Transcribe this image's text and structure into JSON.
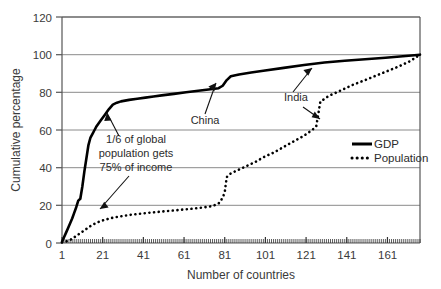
{
  "chart_data": {
    "type": "line",
    "title": "",
    "xlabel": "Number of countries",
    "ylabel": "Cumulative percentage",
    "xlim": [
      1,
      177
    ],
    "ylim": [
      0,
      120
    ],
    "xticks": [
      "1",
      "21",
      "41",
      "61",
      "81",
      "101",
      "121",
      "141",
      "161"
    ],
    "xtick_values": [
      1,
      21,
      41,
      61,
      81,
      101,
      121,
      141,
      161
    ],
    "yticks": [
      "0",
      "20",
      "40",
      "60",
      "80",
      "100",
      "120"
    ],
    "ytick_values": [
      0,
      20,
      40,
      60,
      80,
      100,
      120
    ],
    "grid": "horizontal",
    "legend_position": "right-middle",
    "series": [
      {
        "name": "GDP",
        "style": "solid",
        "color": "#000000",
        "x": [
          1,
          2,
          3,
          4,
          5,
          6,
          7,
          8,
          9,
          10,
          11,
          12,
          13,
          14,
          15,
          16,
          17,
          18,
          20,
          22,
          24,
          26,
          28,
          30,
          34,
          38,
          42,
          46,
          50,
          56,
          62,
          68,
          74,
          78,
          80,
          82,
          84,
          88,
          94,
          100,
          110,
          120,
          130,
          140,
          150,
          160,
          170,
          177
        ],
        "values": [
          0.5,
          3,
          5.5,
          8,
          10.5,
          13,
          16,
          19,
          22.5,
          23.5,
          30,
          38,
          45,
          52,
          56,
          58,
          60,
          62,
          65,
          68,
          71,
          73.5,
          74.5,
          75.2,
          76,
          76.6,
          77.2,
          77.8,
          78.4,
          79.2,
          80,
          80.8,
          81.6,
          82.2,
          83.5,
          86.5,
          88.5,
          89.5,
          90.5,
          91.5,
          93,
          94.5,
          95.8,
          96.8,
          97.6,
          98.4,
          99.3,
          100
        ]
      },
      {
        "name": "Population",
        "style": "dotted",
        "color": "#000000",
        "x": [
          1,
          3,
          5,
          7,
          9,
          11,
          13,
          15,
          17,
          19,
          21,
          25,
          30,
          35,
          40,
          45,
          50,
          55,
          60,
          65,
          70,
          75,
          78,
          80,
          81,
          82,
          84,
          88,
          92,
          96,
          100,
          105,
          110,
          115,
          120,
          124,
          125,
          126,
          128,
          132,
          138,
          144,
          150,
          158,
          166,
          172,
          177
        ],
        "values": [
          0.3,
          0.8,
          1.6,
          3,
          4.5,
          6,
          7.5,
          9,
          10.2,
          11.2,
          12,
          13.2,
          14.2,
          15,
          15.6,
          16.2,
          16.7,
          17.2,
          17.7,
          18.2,
          18.8,
          19.6,
          21,
          24,
          27,
          35,
          37,
          39,
          41,
          43,
          45.5,
          48,
          51,
          54,
          57,
          60,
          61,
          62,
          75,
          78,
          81,
          84,
          86.5,
          90,
          93.5,
          96.5,
          100
        ]
      }
    ],
    "annotations": [
      {
        "name": "income-annotation",
        "text_lines": [
          "1/6 of global",
          "population gets",
          "75% of income"
        ],
        "points_to": [
          "GDP curve near 21 countries",
          "Population curve near 25 countries"
        ]
      },
      {
        "name": "china-annotation",
        "text_lines": [
          "China"
        ],
        "points_to": [
          "GDP curve near 79 countries",
          "Population curve jump at 81"
        ]
      },
      {
        "name": "india-annotation",
        "text_lines": [
          "India"
        ],
        "points_to": [
          "GDP curve near 124 countries",
          "Population curve jump at 126"
        ]
      }
    ]
  },
  "legend": {
    "items": [
      {
        "label": "GDP",
        "style": "solid"
      },
      {
        "label": "Population",
        "style": "dotted"
      }
    ]
  },
  "axis": {
    "ylabel": "Cumulative percentage",
    "xlabel": "Number of countries"
  },
  "annotations": {
    "income_line1": "1/6 of global",
    "income_line2": "population gets",
    "income_line3": "75% of income",
    "china": "China",
    "india": "India"
  }
}
